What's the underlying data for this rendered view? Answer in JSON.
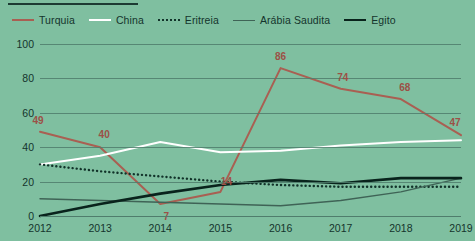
{
  "colors": {
    "background": "#7fbfa0",
    "grid": "#4f7d6c",
    "text": "#14342c",
    "turquia": "#a95f52",
    "china": "#ffffff",
    "eritreia": "#12332a",
    "arabia_saudita": "#3f6356",
    "egito": "#09231c",
    "label": "#9c5046"
  },
  "legend": {
    "items": [
      {
        "label": "Turquia",
        "color": "#a95f52",
        "style": "solid",
        "width": 2
      },
      {
        "label": "China",
        "color": "#ffffff",
        "style": "solid",
        "width": 2
      },
      {
        "label": "Eritreia",
        "color": "#12332a",
        "style": "dotted",
        "width": 2
      },
      {
        "label": "Arábia Saudita",
        "color": "#3f6356",
        "style": "solid",
        "width": 1.5
      },
      {
        "label": "Egito",
        "color": "#09231c",
        "style": "solid",
        "width": 2.6
      }
    ]
  },
  "chart_data": {
    "type": "line",
    "title": "",
    "xlabel": "",
    "ylabel": "",
    "categories": [
      "2012",
      "2013",
      "2014",
      "2015",
      "2016",
      "2017",
      "2018",
      "2019"
    ],
    "x": [
      2012,
      2013,
      2014,
      2015,
      2016,
      2017,
      2018,
      2019
    ],
    "ylim": [
      0,
      100
    ],
    "yticks": [
      0,
      20,
      40,
      60,
      80,
      100
    ],
    "ytick_labels": [
      "0",
      "20",
      "40",
      "60",
      "80",
      "100"
    ],
    "grid": true,
    "legend_position": "top-left",
    "series": [
      {
        "name": "Turquia",
        "color": "#a95f52",
        "style": "solid",
        "values": [
          49,
          40,
          7,
          14,
          86,
          74,
          68,
          47
        ],
        "data_labels": [
          "49",
          "40",
          "7",
          "14",
          "86",
          "74",
          "68",
          "47"
        ]
      },
      {
        "name": "China",
        "color": "#ffffff",
        "style": "solid",
        "values": [
          30,
          35,
          43,
          37,
          38,
          41,
          43,
          44
        ],
        "data_labels": []
      },
      {
        "name": "Eritreia",
        "color": "#12332a",
        "style": "dotted",
        "values": [
          30,
          26,
          23,
          20,
          18,
          17,
          17,
          17
        ],
        "data_labels": []
      },
      {
        "name": "Arábia Saudita",
        "color": "#3f6356",
        "style": "solid",
        "values": [
          10,
          9,
          8,
          7,
          6,
          9,
          14,
          22
        ],
        "data_labels": []
      },
      {
        "name": "Egito",
        "color": "#09231c",
        "style": "solid",
        "values": [
          0,
          7,
          13,
          18,
          21,
          19,
          22,
          22
        ],
        "data_labels": []
      }
    ]
  }
}
